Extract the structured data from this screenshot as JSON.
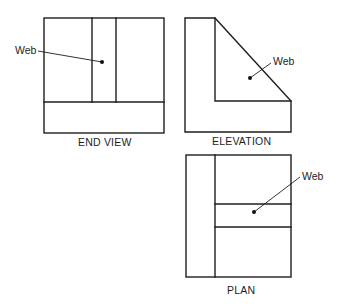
{
  "figure": {
    "background": "#ffffff",
    "line_color": "#1e1e1e",
    "views": [
      {
        "id": "end-view",
        "title": "END VIEW",
        "callout": "Web"
      },
      {
        "id": "elevation",
        "title": "ELEVATION",
        "callout": "Web"
      },
      {
        "id": "plan",
        "title": "PLAN",
        "callout": "Web"
      }
    ]
  }
}
